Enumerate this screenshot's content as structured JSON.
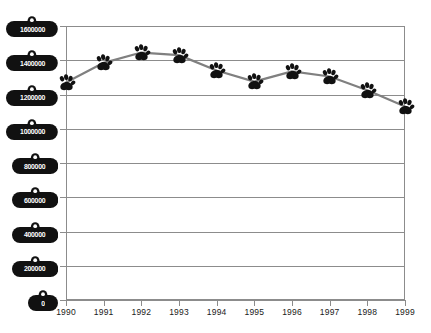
{
  "chart_data": {
    "type": "line",
    "title": "",
    "subtitle": "",
    "xlabel": "",
    "ylabel": "",
    "categories": [
      "1990",
      "1991",
      "1992",
      "1993",
      "1994",
      "1995",
      "1996",
      "1997",
      "1998",
      "1999"
    ],
    "values": [
      1270000,
      1385000,
      1445000,
      1430000,
      1340000,
      1275000,
      1335000,
      1305000,
      1225000,
      1130000
    ],
    "series": [
      {
        "name": "",
        "values": [
          1270000,
          1385000,
          1445000,
          1430000,
          1340000,
          1275000,
          1335000,
          1305000,
          1225000,
          1130000
        ]
      }
    ],
    "ylim": [
      0,
      1600000
    ],
    "xlim": [
      "1990",
      "1999"
    ],
    "yticks": [
      0,
      200000,
      400000,
      600000,
      800000,
      1000000,
      1200000,
      1400000,
      1600000
    ],
    "ytick_labels": [
      "0",
      "200000",
      "400000",
      "600000",
      "800000",
      "1000000",
      "1200000",
      "1400000",
      "1600000"
    ],
    "xtick_labels": [
      "1990",
      "1991",
      "1992",
      "1993",
      "1994",
      "1995",
      "1996",
      "1997",
      "1998",
      "1999"
    ],
    "grid": true,
    "legend": false,
    "legend_position": "none",
    "marker": "paw-print-icon",
    "ytick_label_shape": "dog-tag-icon",
    "colors": {
      "line": "#808080",
      "marker": "#111111",
      "grid": "#8c8c8c",
      "axis": "#8c8c8c",
      "tag_fill": "#111111",
      "tag_text": "#ffffff",
      "background": "#ffffff",
      "xtick_text": "#1a1a1a"
    }
  }
}
